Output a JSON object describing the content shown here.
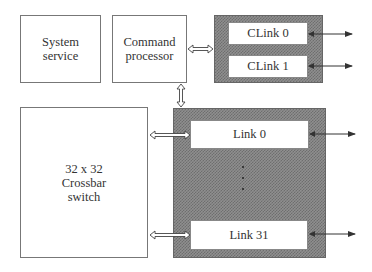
{
  "diagram": {
    "system_service": {
      "line1": "System",
      "line2": "service"
    },
    "command_processor": {
      "line1": "Command",
      "line2": "processor"
    },
    "clinks": [
      {
        "label": "CLink 0"
      },
      {
        "label": "CLink 1"
      }
    ],
    "crossbar": {
      "line1": "32 x 32",
      "line2": "Crossbar",
      "line3": "switch"
    },
    "links": [
      {
        "label": "Link 0"
      },
      {
        "label": "Link 31"
      }
    ],
    "ellipsis": "...",
    "colors": {
      "shade": "#8f8f8f",
      "border": "#777777",
      "arrow": "#333333"
    }
  }
}
